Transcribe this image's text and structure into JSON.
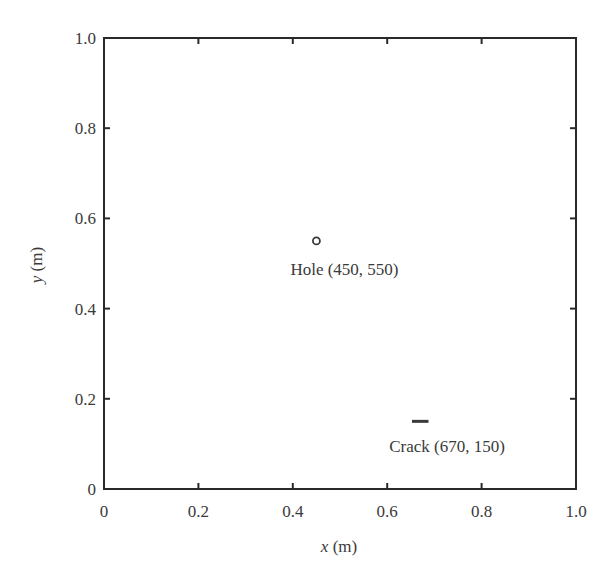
{
  "chart_data": {
    "type": "scatter",
    "title": "",
    "xlabel": "x (m)",
    "ylabel": "y (m)",
    "xlabel_var": "x",
    "xlabel_unit": " (m)",
    "ylabel_var": "y",
    "ylabel_unit": " (m)",
    "xlim": [
      0,
      1.0
    ],
    "ylim": [
      0,
      1.0
    ],
    "grid": false,
    "legend": null,
    "xticks": [
      0,
      0.2,
      0.4,
      0.6,
      0.8,
      1.0
    ],
    "yticks": [
      0,
      0.2,
      0.4,
      0.6,
      0.8,
      1.0
    ],
    "xtick_labels": [
      "0",
      "0.2",
      "0.4",
      "0.6",
      "0.8",
      "1.0"
    ],
    "ytick_labels": [
      "0",
      "0.2",
      "0.4",
      "0.6",
      "0.8",
      "1.0"
    ],
    "series": [
      {
        "name": "Hole",
        "marker": "circle",
        "points": [
          {
            "x": 0.45,
            "y": 0.55
          }
        ],
        "annotation": "Hole (450, 550)"
      },
      {
        "name": "Crack",
        "marker": "horizontal-line",
        "points": [
          {
            "x": 0.67,
            "y": 0.15
          }
        ],
        "length": 0.035,
        "annotation": "Crack (670, 150)"
      }
    ]
  }
}
